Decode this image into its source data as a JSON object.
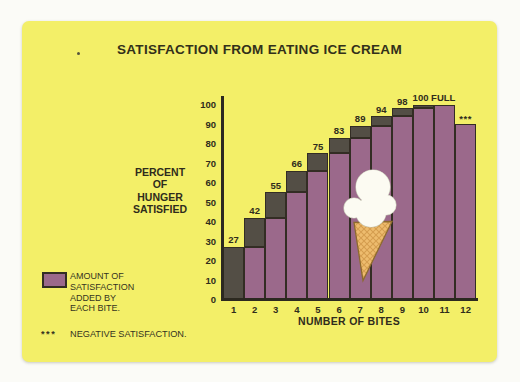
{
  "card": {
    "title": "SATISFACTION FROM EATING ICE CREAM"
  },
  "chart_data": {
    "type": "bar",
    "title": "SATISFACTION FROM EATING ICE CREAM",
    "xlabel": "NUMBER OF BITES",
    "ylabel": "PERCENT OF HUNGER SATISFIED",
    "ylabel_lines": [
      "PERCENT",
      "OF",
      "HUNGER",
      "SATISFIED"
    ],
    "categories": [
      "1",
      "2",
      "3",
      "4",
      "5",
      "6",
      "7",
      "8",
      "9",
      "10",
      "11",
      "12"
    ],
    "values": [
      27,
      42,
      55,
      66,
      75,
      83,
      89,
      94,
      98,
      100,
      100,
      90
    ],
    "bar_labels": [
      "27",
      "42",
      "55",
      "66",
      "75",
      "83",
      "89",
      "94",
      "98",
      "100 FULL",
      "",
      "***"
    ],
    "note": "each column shows the previous cumulative percent in purple with the amount added by that bite as a dark cap; bite 12 decreases to 90 and is marked ***",
    "y_ticks": [
      0,
      10,
      20,
      30,
      40,
      50,
      60,
      70,
      80,
      90,
      100
    ],
    "ylim": [
      0,
      100
    ],
    "grid": false,
    "legend_position": "bottom-left",
    "colors": {
      "bar_purple": "#9b698b",
      "increment_dark": "#534e45",
      "outline": "#332d24",
      "card_background": "#f3ef68",
      "text": "#2f2c1c"
    }
  },
  "legend": {
    "swatch_color": "#9b698b",
    "lines": [
      "AMOUNT OF",
      "SATISFACTION",
      "ADDED BY",
      "EACH BITE."
    ]
  },
  "footnote": {
    "symbol": "***",
    "text": "NEGATIVE SATISFACTION."
  },
  "illustration": {
    "name": "ice-cream-cone"
  }
}
